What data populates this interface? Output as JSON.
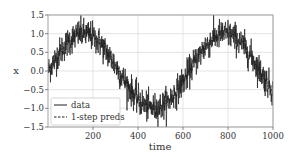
{
  "chart_data": {
    "type": "line",
    "title": "",
    "xlabel": "time",
    "ylabel": "x",
    "xlim": [
      1,
      1000
    ],
    "ylim": [
      -1.5,
      1.5
    ],
    "grid": true,
    "legend_position": "lower left",
    "x_ticks": [
      200,
      400,
      600,
      800,
      1000
    ],
    "x_tick_labels": [
      "200",
      "400",
      "600",
      "800",
      "1000"
    ],
    "y_ticks": [
      -1.5,
      -1.0,
      -0.5,
      0.0,
      0.5,
      1.0,
      1.5
    ],
    "y_tick_labels": [
      "−1.5",
      "−1.0",
      "−0.5",
      "0.0",
      "0.5",
      "1.0",
      "1.5"
    ],
    "series": [
      {
        "name": "data",
        "style": "solid",
        "color": "#1f1f1f",
        "description": "noisy sine: x = sin(0.01 t) + noise (sd≈0.2)",
        "x": [
          1,
          100,
          157,
          200,
          300,
          400,
          471,
          500,
          600,
          700,
          785,
          800,
          900,
          1000
        ],
        "values": [
          0.0,
          0.84,
          1.0,
          0.91,
          0.14,
          -0.76,
          -1.0,
          -0.96,
          -0.28,
          0.66,
          1.0,
          0.99,
          0.41,
          -0.54
        ]
      },
      {
        "name": "1-step preds",
        "style": "dashed",
        "color": "#1f1f1f",
        "description": "one-step-ahead predictions, closely tracking the data",
        "x": [
          5,
          100,
          157,
          200,
          300,
          400,
          471,
          500,
          600,
          700,
          785,
          800,
          900,
          1000
        ],
        "values": [
          0.05,
          0.84,
          1.0,
          0.91,
          0.14,
          -0.76,
          -1.0,
          -0.96,
          -0.28,
          0.66,
          1.0,
          0.99,
          0.41,
          -0.54
        ]
      }
    ]
  },
  "legend": {
    "items": [
      {
        "label": "data",
        "style": "solid"
      },
      {
        "label": "1-step preds",
        "style": "dashed"
      }
    ]
  },
  "axes": {
    "xlabel": "time",
    "ylabel": "x"
  },
  "colors": {
    "line": "#1f1f1f",
    "grid": "#d8d8d8",
    "frame": "#9a9a9a",
    "text": "#333333"
  }
}
